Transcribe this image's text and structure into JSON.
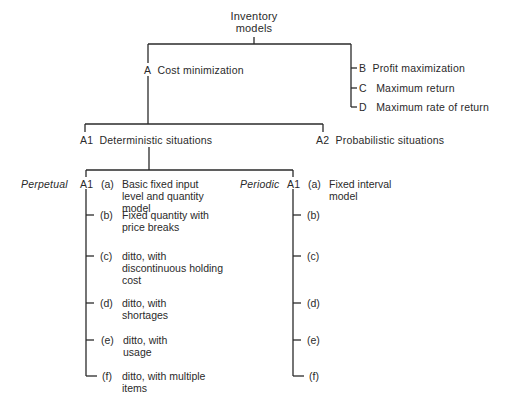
{
  "root": {
    "line1": "Inventory",
    "line2": "models"
  },
  "level1": {
    "A": {
      "code": "A",
      "label": "Cost minimization"
    },
    "B": {
      "code": "B",
      "label": "Profit maximization"
    },
    "C": {
      "code": "C",
      "label": "Maximum return"
    },
    "D": {
      "code": "D",
      "label": "Maximum rate of return"
    }
  },
  "level2": {
    "A1": {
      "code": "A1",
      "label": "Deterministic situations"
    },
    "A2": {
      "code": "A2",
      "label": "Probabilistic situations"
    }
  },
  "perpetual": {
    "title": "Perpetual",
    "code": "A1",
    "items": [
      {
        "key": "(a)",
        "lines": [
          "Basic fixed input",
          "level and quantity",
          "model"
        ]
      },
      {
        "key": "(b)",
        "lines": [
          "Fixed quantity with",
          "price breaks"
        ]
      },
      {
        "key": "(c)",
        "lines": [
          "ditto, with",
          "discontinuous holding",
          "cost"
        ]
      },
      {
        "key": "(d)",
        "lines": [
          "ditto, with",
          "shortages"
        ]
      },
      {
        "key": "(e)",
        "lines": [
          "ditto, with",
          "usage"
        ]
      },
      {
        "key": "(f)",
        "lines": [
          "ditto, with multiple",
          "items"
        ]
      }
    ]
  },
  "periodic": {
    "title": "Periodic",
    "code": "A1",
    "items": [
      {
        "key": "(a)",
        "lines": [
          "Fixed interval",
          "model"
        ]
      },
      {
        "key": "(b)"
      },
      {
        "key": "(c)"
      },
      {
        "key": "(d)"
      },
      {
        "key": "(e)"
      },
      {
        "key": "(f)"
      }
    ]
  }
}
